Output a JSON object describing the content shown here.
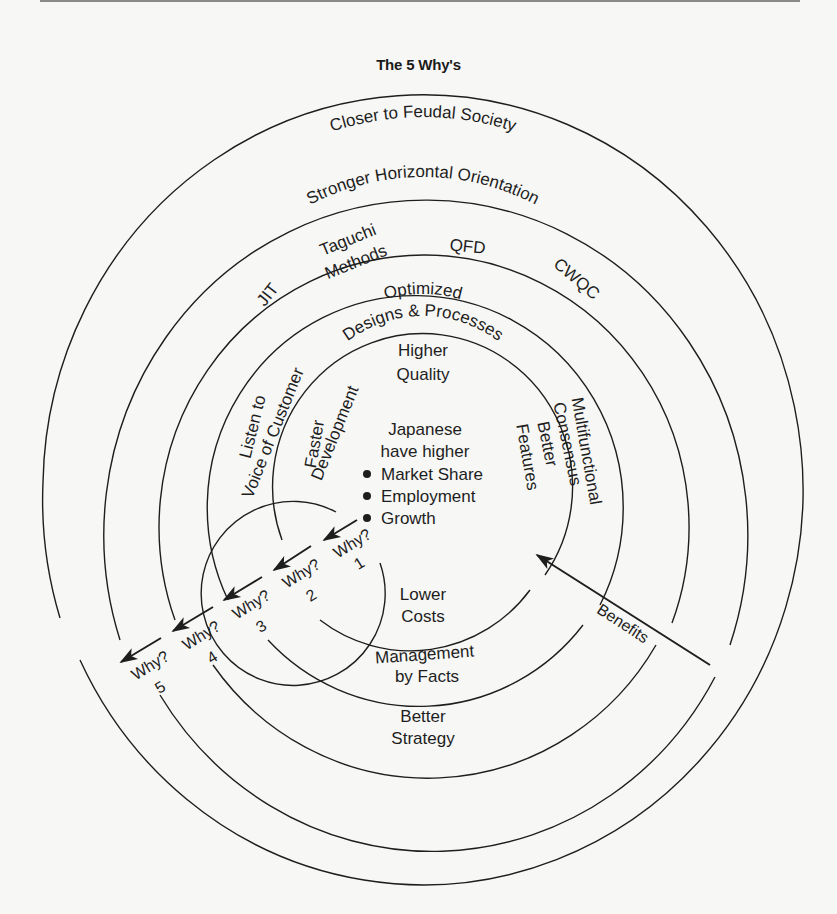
{
  "figure": {
    "title": "The 5 Why's",
    "rings": {
      "ring6_outer": "Closer to Feudal Society",
      "ring5": "Stronger Horizontal Orientation",
      "ring4": {
        "left": "JIT",
        "upper_left_line1": "Taguchi",
        "upper_left_line2": "Methods",
        "top": "QFD",
        "right": "CWQC"
      },
      "ring3": {
        "top_line1": "Optimized",
        "top_line2": "Designs & Processes",
        "left_line1": "Listen to",
        "left_line2": "Voice of Customer",
        "right_line1": "Multifunctional",
        "right_line2": "Consensus",
        "bottom_line1": "Better",
        "bottom_line2": "Strategy"
      },
      "ring2": {
        "top_line1": "Higher",
        "top_line2": "Quality",
        "left_line1": "Faster",
        "left_line2": "Development",
        "right_line1": "Better",
        "right_line2": "Features",
        "bottom_line1": "Management",
        "bottom_line2": "by Facts"
      },
      "ring1": {
        "bottom_line1": "Lower",
        "bottom_line2": "Costs"
      }
    },
    "center": {
      "line1": "Japanese",
      "line2": "have higher",
      "bullets": [
        "Market Share",
        "Employment",
        "Growth"
      ]
    },
    "why_steps": [
      {
        "label": "Why?",
        "number": "1"
      },
      {
        "label": "Why?",
        "number": "2"
      },
      {
        "label": "Why?",
        "number": "3"
      },
      {
        "label": "Why?",
        "number": "4"
      },
      {
        "label": "Why?",
        "number": "5"
      }
    ],
    "benefits_arrow_label": "Benefits"
  }
}
